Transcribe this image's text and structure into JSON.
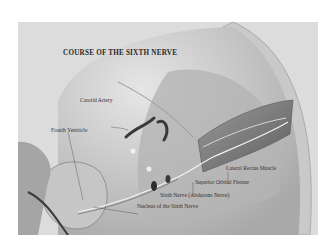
{
  "figure": {
    "title": "COURSE OF THE SIXTH NERVE",
    "labels": [
      {
        "id": "carotid-artery",
        "text": "Carotid Artery",
        "x": 80,
        "y": 98
      },
      {
        "id": "fourth-ventricle",
        "text": "Fourth Ventricle",
        "x": 51,
        "y": 128
      },
      {
        "id": "lateral-rectus-muscle",
        "text": "Lateral Rectus Muscle",
        "x": 226,
        "y": 166
      },
      {
        "id": "superior-orbital-fissure",
        "text": "Superior Orbital Fissure",
        "x": 195,
        "y": 180
      },
      {
        "id": "sixth-nerve",
        "text": "Sixth Nerve (Abducens Nerve)",
        "x": 160,
        "y": 193
      },
      {
        "id": "nucleus-sixth-nerve",
        "text": "Nucleus of the Sixth Nerve",
        "x": 137,
        "y": 204
      }
    ]
  },
  "colors": {
    "background": "#ffffff",
    "frame": "#d9d9d9",
    "skull_shade": "#bdbdbd",
    "dark_shade": "#6e6e6e",
    "label_text": "#333333"
  }
}
